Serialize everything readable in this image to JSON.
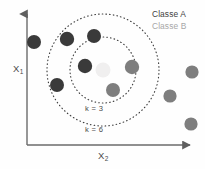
{
  "diagram": {
    "axes": {
      "y_label": "X",
      "y_label_sub": "1",
      "x_label": "X",
      "x_label_sub": "2",
      "axis_color": "#6b6b6b"
    },
    "legend": {
      "items": [
        {
          "label": "Classe A",
          "color": "#3f3f3f"
        },
        {
          "label": "Classe B",
          "color": "#a7a7a7"
        }
      ]
    },
    "rings": [
      {
        "label": "k = 3",
        "cx": 103,
        "cy": 70,
        "r": 33,
        "style": "dotted",
        "color": "#3d3d3d"
      },
      {
        "label": "k = 6",
        "cx": 103,
        "cy": 70,
        "r": 56,
        "style": "dotted",
        "color": "#3d3d3d"
      }
    ],
    "query_point": {
      "cx": 103,
      "cy": 70,
      "r": 7.5,
      "color": "#f0efef"
    },
    "points": [
      {
        "class": "A",
        "cx": 34,
        "cy": 42,
        "r": 7.0,
        "color": "#3a3a3a",
        "inside": "none"
      },
      {
        "class": "A",
        "cx": 67,
        "cy": 39,
        "r": 7.2,
        "color": "#3a3a3a",
        "inside": "k6"
      },
      {
        "class": "A",
        "cx": 94,
        "cy": 36,
        "r": 7.0,
        "color": "#3a3a3a",
        "inside": "k6"
      },
      {
        "class": "A",
        "cx": 57,
        "cy": 85,
        "r": 7.0,
        "color": "#3a3a3a",
        "inside": "k6"
      },
      {
        "class": "A",
        "cx": 85,
        "cy": 66,
        "r": 7.2,
        "color": "#3a3a3a",
        "inside": "k3"
      },
      {
        "class": "B",
        "cx": 132,
        "cy": 67,
        "r": 7.2,
        "color": "#7e7e7e",
        "inside": "k3"
      },
      {
        "class": "B",
        "cx": 113,
        "cy": 90,
        "r": 7.0,
        "color": "#7e7e7e",
        "inside": "k3"
      },
      {
        "class": "B",
        "cx": 170,
        "cy": 96,
        "r": 6.6,
        "color": "#7e7e7e",
        "inside": "none"
      },
      {
        "class": "B",
        "cx": 192,
        "cy": 72,
        "r": 6.6,
        "color": "#7e7e7e",
        "inside": "none"
      },
      {
        "class": "B",
        "cx": 191,
        "cy": 124,
        "r": 6.6,
        "color": "#7e7e7e",
        "inside": "none"
      }
    ]
  },
  "chart_data": {
    "type": "scatter",
    "xlabel": "X2",
    "ylabel": "X1",
    "legend": [
      "Classe A",
      "Classe B"
    ],
    "annotations": [
      "k = 3",
      "k = 6"
    ],
    "series": [
      {
        "name": "Classe A",
        "color": "#3a3a3a",
        "points": [
          [
            34,
            42
          ],
          [
            67,
            39
          ],
          [
            94,
            36
          ],
          [
            57,
            85
          ],
          [
            85,
            66
          ]
        ]
      },
      {
        "name": "Classe B",
        "color": "#7e7e7e",
        "points": [
          [
            132,
            67
          ],
          [
            113,
            90
          ],
          [
            170,
            96
          ],
          [
            192,
            72
          ],
          [
            191,
            124
          ]
        ]
      },
      {
        "name": "Query point",
        "color": "#f0efef",
        "points": [
          [
            103,
            70
          ]
        ]
      }
    ],
    "neighborhood_counts": {
      "k = 3": {
        "Classe A": 1,
        "Classe B": 2
      },
      "k = 6": {
        "Classe A": 4,
        "Classe B": 2
      }
    },
    "grid": false,
    "legend_position": "top-right"
  }
}
